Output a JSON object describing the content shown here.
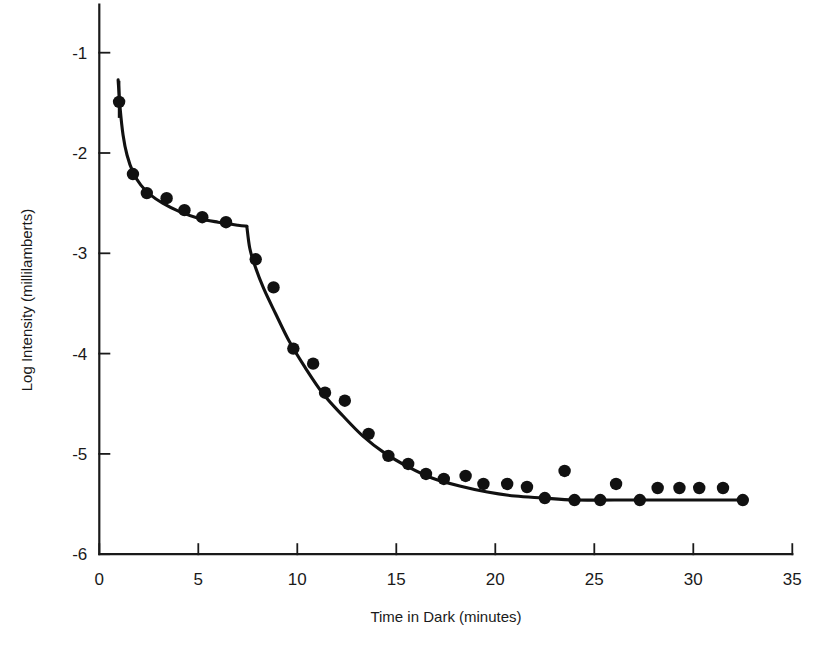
{
  "figure": {
    "background_color": "#ffffff",
    "ink_color": "#111111"
  },
  "chart_data": {
    "type": "scatter",
    "title": "",
    "subtitle": "",
    "xlabel": "Time in Dark (minutes)",
    "ylabel": "Log Intensity (millilamberts)",
    "xlim": [
      0,
      35
    ],
    "ylim": [
      -6,
      -0.6
    ],
    "grid": false,
    "legend": null,
    "legend_position": "none",
    "xticks": [
      0,
      5,
      10,
      15,
      20,
      25,
      30,
      35
    ],
    "xtick_labels": [
      "0",
      "5",
      "10",
      "15",
      "20",
      "25",
      "30",
      "35"
    ],
    "yticks": [
      -1,
      -2,
      -3,
      -4,
      -5,
      -6
    ],
    "ytick_labels": [
      "-1",
      "-2",
      "-3",
      "-4",
      "-5",
      "-6"
    ],
    "series": [
      {
        "name": "Dark adaptation threshold measurements",
        "marker": "filled-circle",
        "marker_color": "#111111",
        "marker_radius": 6.2,
        "points": [
          {
            "x": 1.0,
            "y": -1.49
          },
          {
            "x": 1.7,
            "y": -2.21
          },
          {
            "x": 2.4,
            "y": -2.4
          },
          {
            "x": 3.4,
            "y": -2.45
          },
          {
            "x": 4.3,
            "y": -2.57
          },
          {
            "x": 5.2,
            "y": -2.64
          },
          {
            "x": 6.4,
            "y": -2.69
          },
          {
            "x": 7.9,
            "y": -3.06
          },
          {
            "x": 8.8,
            "y": -3.34
          },
          {
            "x": 9.8,
            "y": -3.95
          },
          {
            "x": 10.8,
            "y": -4.1
          },
          {
            "x": 11.4,
            "y": -4.39
          },
          {
            "x": 12.4,
            "y": -4.47
          },
          {
            "x": 13.6,
            "y": -4.8
          },
          {
            "x": 14.6,
            "y": -5.02
          },
          {
            "x": 15.6,
            "y": -5.1
          },
          {
            "x": 16.5,
            "y": -5.2
          },
          {
            "x": 17.4,
            "y": -5.25
          },
          {
            "x": 18.5,
            "y": -5.22
          },
          {
            "x": 19.4,
            "y": -5.3
          },
          {
            "x": 20.6,
            "y": -5.3
          },
          {
            "x": 21.6,
            "y": -5.33
          },
          {
            "x": 22.5,
            "y": -5.44
          },
          {
            "x": 23.5,
            "y": -5.17
          },
          {
            "x": 24.0,
            "y": -5.46
          },
          {
            "x": 25.3,
            "y": -5.46
          },
          {
            "x": 26.1,
            "y": -5.3
          },
          {
            "x": 27.3,
            "y": -5.46
          },
          {
            "x": 28.2,
            "y": -5.34
          },
          {
            "x": 29.3,
            "y": -5.34
          },
          {
            "x": 30.3,
            "y": -5.34
          },
          {
            "x": 31.5,
            "y": -5.34
          },
          {
            "x": 32.5,
            "y": -5.46
          }
        ]
      }
    ],
    "error_bars": [
      {
        "x": 1.0,
        "y_low": -1.65,
        "y_high": -1.28
      }
    ],
    "fit_curves": [
      {
        "name": "cone-branch",
        "color": "#111111",
        "points": [
          {
            "x": 0.95,
            "y": -1.27
          },
          {
            "x": 1.05,
            "y": -1.55
          },
          {
            "x": 1.2,
            "y": -1.82
          },
          {
            "x": 1.4,
            "y": -2.02
          },
          {
            "x": 1.7,
            "y": -2.19
          },
          {
            "x": 2.1,
            "y": -2.32
          },
          {
            "x": 2.6,
            "y": -2.42
          },
          {
            "x": 3.2,
            "y": -2.5
          },
          {
            "x": 4.0,
            "y": -2.58
          },
          {
            "x": 5.0,
            "y": -2.65
          },
          {
            "x": 6.0,
            "y": -2.69
          },
          {
            "x": 7.0,
            "y": -2.72
          },
          {
            "x": 7.45,
            "y": -2.73
          }
        ]
      },
      {
        "name": "rod-branch",
        "color": "#111111",
        "points": [
          {
            "x": 7.45,
            "y": -2.73
          },
          {
            "x": 7.6,
            "y": -2.95
          },
          {
            "x": 7.85,
            "y": -3.12
          },
          {
            "x": 8.3,
            "y": -3.35
          },
          {
            "x": 8.9,
            "y": -3.6
          },
          {
            "x": 9.6,
            "y": -3.88
          },
          {
            "x": 10.4,
            "y": -4.14
          },
          {
            "x": 11.3,
            "y": -4.4
          },
          {
            "x": 12.3,
            "y": -4.62
          },
          {
            "x": 13.3,
            "y": -4.82
          },
          {
            "x": 14.4,
            "y": -4.99
          },
          {
            "x": 15.6,
            "y": -5.13
          },
          {
            "x": 16.8,
            "y": -5.24
          },
          {
            "x": 18.2,
            "y": -5.32
          },
          {
            "x": 19.6,
            "y": -5.38
          },
          {
            "x": 21.0,
            "y": -5.42
          },
          {
            "x": 22.4,
            "y": -5.44
          },
          {
            "x": 24.0,
            "y": -5.46
          },
          {
            "x": 26.0,
            "y": -5.46
          },
          {
            "x": 28.5,
            "y": -5.46
          },
          {
            "x": 30.5,
            "y": -5.46
          },
          {
            "x": 32.5,
            "y": -5.46
          }
        ]
      }
    ],
    "annotations": []
  }
}
